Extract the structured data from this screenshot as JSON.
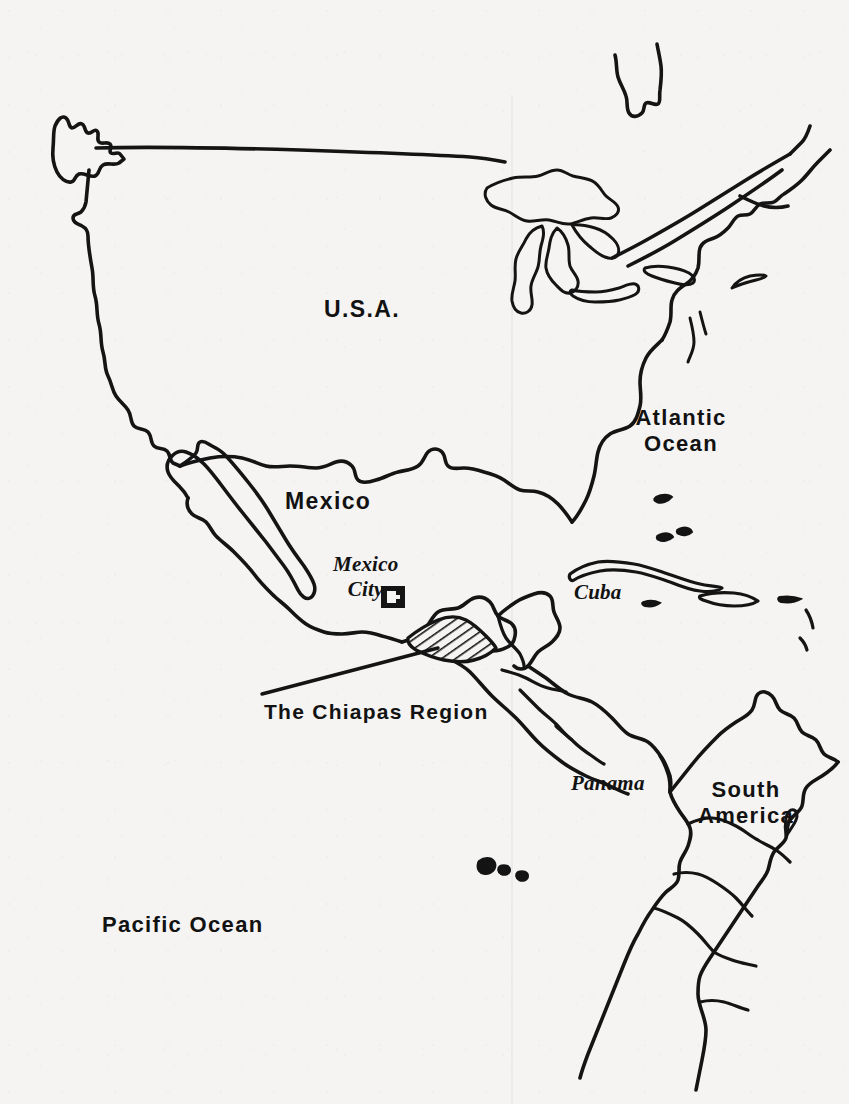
{
  "map": {
    "title": "Map of North and Central America showing The Chiapas Region",
    "background_color": "#f5f4f2",
    "ink_color": "#141414",
    "labels": {
      "usa": "U.S.A.",
      "mexico": "Mexico",
      "mexico_city": "Mexico\nCity",
      "cuba": "Cuba",
      "panama": "Panama",
      "south_america": "South\nAmerica",
      "atlantic_ocean": "Atlantic\nOcean",
      "pacific_ocean": "Pacific Ocean",
      "chiapas_region": "The Chiapas Region"
    },
    "markers": {
      "capital_city_symbol": "capital-city-square-marker",
      "highlight_region": "hatched-region-fill"
    }
  }
}
